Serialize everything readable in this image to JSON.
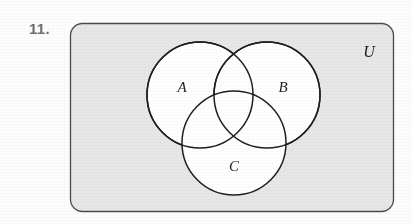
{
  "figure": {
    "problem_number": "11.",
    "type": "venn-diagram",
    "sets": 3,
    "universe": {
      "label": "U",
      "shape": "rounded-rectangle",
      "fill_color": "#e7e7e7",
      "stroke_color": "#555555"
    },
    "circles": [
      {
        "label": "A",
        "cx": 200,
        "cy": 95,
        "r": 53,
        "label_x": 182,
        "label_y": 92,
        "fill_color": "#ffffff",
        "stroke_color": "#1f1f1f"
      },
      {
        "label": "B",
        "cx": 267,
        "cy": 95,
        "r": 53,
        "label_x": 279,
        "label_y": 92,
        "fill_color": "#ffffff",
        "stroke_color": "#1f1f1f"
      },
      {
        "label": "C",
        "cx": 234,
        "cy": 143,
        "r": 52,
        "label_x": 229,
        "label_y": 171,
        "fill_color": "#ffffff",
        "stroke_color": "#1f1f1f"
      }
    ],
    "universe_label_position": {
      "x": 369,
      "y": 57
    },
    "background_color": "#fdfdfd"
  }
}
